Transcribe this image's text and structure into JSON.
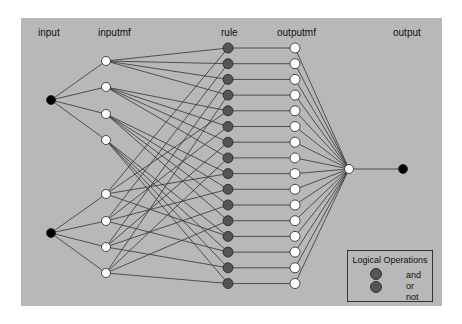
{
  "labels": {
    "input": "input",
    "inputmf": "inputmf",
    "rule": "rule",
    "outputmf": "outputmf",
    "output": "output"
  },
  "legend": {
    "title": "Logical Operations",
    "items": [
      "and",
      "or",
      "not"
    ]
  },
  "colors": {
    "background": "#b8b8b8",
    "input_node": "#000000",
    "mf_node": "#ffffff",
    "rule_node": "#555555",
    "edge": "#333333"
  },
  "network": {
    "inputs": 2,
    "inputmfs_per_input": 4,
    "rules": 16,
    "outputmfs": 16,
    "outputs": 1
  }
}
